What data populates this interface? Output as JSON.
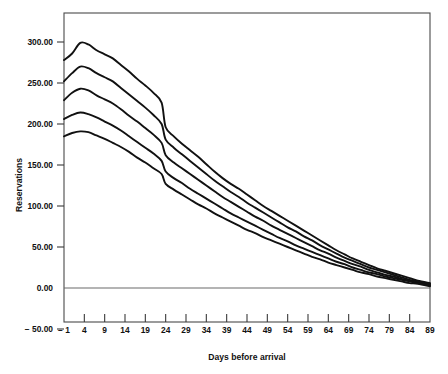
{
  "chart_data": {
    "type": "line",
    "title": "",
    "xlabel": "Days before arrival",
    "ylabel": "Reservations",
    "xlim": [
      -1,
      89
    ],
    "ylim": [
      -50,
      310
    ],
    "grid": false,
    "legend": "none",
    "x_tick_labels": [
      "− 1",
      "4",
      "9",
      "14",
      "19",
      "24",
      "29",
      "34",
      "39",
      "44",
      "49",
      "54",
      "59",
      "64",
      "69",
      "74",
      "79",
      "84",
      "89"
    ],
    "x_ticks": [
      -1,
      4,
      9,
      14,
      19,
      24,
      29,
      34,
      39,
      44,
      49,
      54,
      59,
      64,
      69,
      74,
      79,
      84,
      89
    ],
    "y_tick_labels": [
      "300.00",
      "250.00",
      "200.00",
      "150.00",
      "100.00",
      "50.00",
      "0.00",
      "− 50.00"
    ],
    "y_ticks": [
      300,
      250,
      200,
      150,
      100,
      50,
      0,
      -50
    ],
    "x": [
      -1,
      1,
      3,
      5,
      7,
      9,
      11,
      13,
      15,
      17,
      19,
      21,
      23,
      24,
      26,
      28,
      30,
      32,
      34,
      36,
      38,
      40,
      42,
      44,
      46,
      48,
      50,
      52,
      54,
      56,
      58,
      60,
      62,
      64,
      66,
      68,
      70,
      72,
      74,
      76,
      78,
      80,
      82,
      84,
      86,
      89
    ],
    "series": [
      {
        "name": "curve-1",
        "values": [
          278,
          286,
          299,
          297,
          290,
          285,
          280,
          272,
          264,
          255,
          247,
          238,
          226,
          196,
          185,
          176,
          168,
          160,
          151,
          142,
          134,
          127,
          121,
          114,
          107,
          100,
          94,
          88,
          82,
          76,
          70,
          64,
          58,
          52,
          46,
          41,
          36,
          32,
          28,
          24,
          21,
          18,
          15,
          12,
          9,
          6
        ]
      },
      {
        "name": "curve-2",
        "values": [
          252,
          262,
          270,
          268,
          262,
          257,
          252,
          244,
          236,
          228,
          220,
          211,
          200,
          181,
          171,
          163,
          155,
          147,
          139,
          131,
          124,
          117,
          111,
          104,
          98,
          92,
          86,
          80,
          74,
          69,
          63,
          58,
          52,
          47,
          42,
          37,
          33,
          29,
          25,
          22,
          19,
          16,
          13,
          10,
          8,
          5
        ]
      },
      {
        "name": "curve-3",
        "values": [
          229,
          238,
          243,
          241,
          235,
          230,
          225,
          218,
          210,
          203,
          195,
          187,
          177,
          162,
          153,
          146,
          139,
          132,
          125,
          118,
          111,
          105,
          99,
          93,
          87,
          82,
          76,
          71,
          66,
          61,
          56,
          51,
          46,
          42,
          37,
          33,
          29,
          26,
          22,
          19,
          16,
          14,
          11,
          9,
          7,
          4
        ]
      },
      {
        "name": "curve-4",
        "values": [
          206,
          211,
          214,
          212,
          208,
          203,
          198,
          192,
          185,
          178,
          171,
          164,
          155,
          142,
          134,
          128,
          121,
          115,
          109,
          103,
          97,
          91,
          86,
          81,
          76,
          71,
          66,
          61,
          57,
          52,
          48,
          44,
          40,
          36,
          32,
          29,
          25,
          22,
          19,
          17,
          14,
          12,
          10,
          8,
          6,
          3
        ]
      },
      {
        "name": "curve-5",
        "values": [
          185,
          189,
          191,
          190,
          186,
          182,
          177,
          172,
          166,
          159,
          153,
          146,
          139,
          127,
          120,
          114,
          108,
          102,
          97,
          91,
          86,
          81,
          76,
          71,
          67,
          62,
          58,
          54,
          50,
          46,
          42,
          38,
          35,
          31,
          28,
          25,
          22,
          19,
          17,
          14,
          12,
          10,
          8,
          6,
          5,
          2
        ]
      }
    ]
  },
  "plot": {
    "frame_color": "#4a4a4a",
    "line_color": "#111111"
  }
}
